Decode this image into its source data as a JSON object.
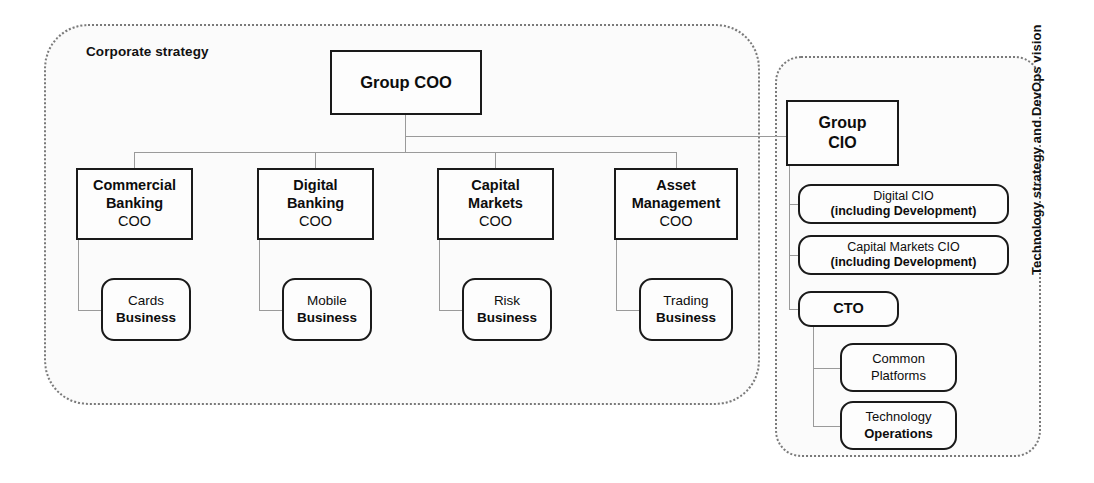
{
  "containers": {
    "corporate_strategy": {
      "label": "Corporate strategy"
    },
    "technology": {
      "label": "Technology strategy and DevOps vision"
    }
  },
  "nodes": {
    "group_coo": {
      "line1": "Group COO"
    },
    "commercial_coo": {
      "line1": "Commercial",
      "line2": "Banking",
      "line3": "COO"
    },
    "digital_coo": {
      "line1": "Digital",
      "line2": "Banking",
      "line3": "COO"
    },
    "capital_coo": {
      "line1": "Capital",
      "line2": "Markets",
      "line3": "COO"
    },
    "asset_coo": {
      "line1": "Asset",
      "line2": "Management",
      "line3": "COO"
    },
    "cards_business": {
      "line1": "Cards",
      "line2": "Business"
    },
    "mobile_business": {
      "line1": "Mobile",
      "line2": "Business"
    },
    "risk_business": {
      "line1": "Risk",
      "line2": "Business"
    },
    "trading_business": {
      "line1": "Trading",
      "line2": "Business"
    },
    "group_cio": {
      "line1": "Group",
      "line2": "CIO"
    },
    "digital_cio": {
      "line1": "Digital CIO",
      "line2": "(including Development)"
    },
    "capital_cio": {
      "line1": "Capital Markets CIO",
      "line2": "(including Development)"
    },
    "cto": {
      "line1": "CTO"
    },
    "common_platforms": {
      "line1": "Common",
      "line2": "Platforms"
    },
    "tech_operations": {
      "line1": "Technology",
      "line2": "Operations"
    }
  },
  "colors": {
    "node_border": "#1a1a1a",
    "container_border": "#7a7a7a",
    "connector": "#9a9a9a",
    "text": "#0d0d0d",
    "background": "#ffffff"
  }
}
